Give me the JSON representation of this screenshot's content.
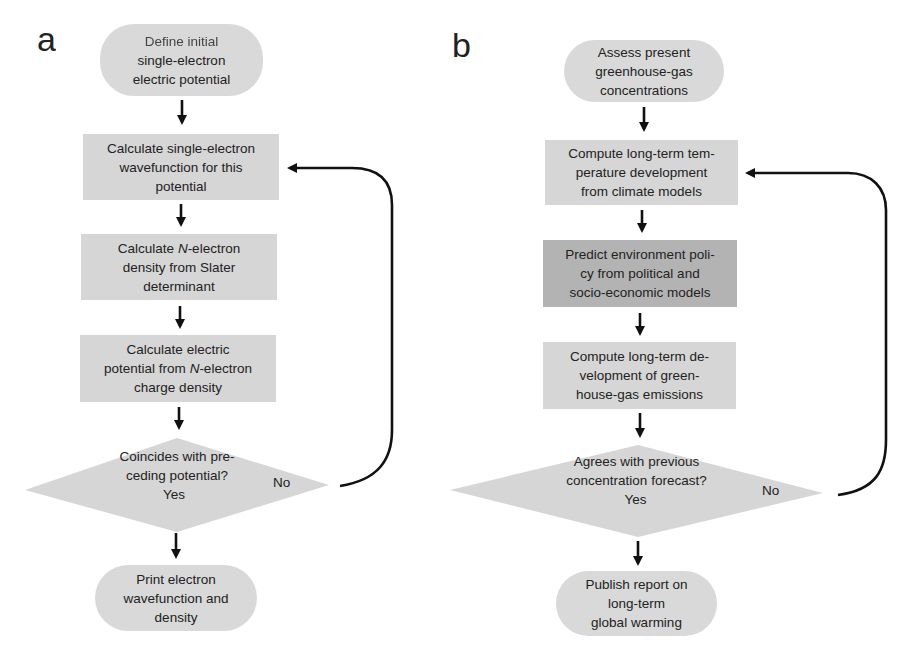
{
  "panels": [
    {
      "label": "a",
      "start": {
        "line1": "Define initial",
        "line2": "single-electron",
        "line3": "electric potential"
      },
      "steps": [
        {
          "lines": [
            "Calculate single-electron",
            "wavefunction for this",
            "potential"
          ],
          "shade": "light"
        },
        {
          "lines": [
            "Calculate N-electron",
            "density from Slater",
            "determinant"
          ],
          "shade": "light"
        },
        {
          "lines": [
            "Calculate electric",
            "potential from N-electron",
            "charge density"
          ],
          "shade": "light"
        }
      ],
      "decision": {
        "line1": "Coincides with pre-",
        "line2": "ceding potential?",
        "yes": "Yes",
        "no": "No"
      },
      "end": {
        "line1": "Print electron",
        "line2": "wavefunction and",
        "line3": "density"
      }
    },
    {
      "label": "b",
      "start": {
        "line1": "Assess present",
        "line2": "greenhouse-gas",
        "line3": "concentrations"
      },
      "steps": [
        {
          "lines": [
            "Compute long-term tem-",
            "perature development",
            "from climate models"
          ],
          "shade": "light"
        },
        {
          "lines": [
            "Predict environment poli-",
            "cy from political and",
            "socio-economic models"
          ],
          "shade": "dark"
        },
        {
          "lines": [
            "Compute long-term de-",
            "velopment of  green-",
            "house-gas emissions"
          ],
          "shade": "light"
        }
      ],
      "decision": {
        "line1": "Agrees with previous",
        "line2": "concentration forecast?",
        "yes": "Yes",
        "no": "No"
      },
      "end": {
        "line1": "Publish report on",
        "line2": "long-term",
        "line3": "global warming"
      }
    }
  ],
  "colors": {
    "light_fill": "#d6d6d6",
    "dark_fill": "#b3b3b3",
    "pill_fill": "#d9d9d9",
    "arrow": "#111111"
  }
}
